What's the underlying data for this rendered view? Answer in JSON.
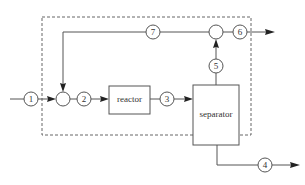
{
  "diagram": {
    "type": "process-flow",
    "units": {
      "reactor": "reactor",
      "separator": "separator"
    },
    "streams": {
      "s1": "1",
      "s2": "2",
      "s3": "3",
      "s4": "4",
      "s5": "5",
      "s6": "6",
      "s7": "7"
    },
    "mixers": [
      "feed-mixer",
      "top-mixer"
    ],
    "boundary": "dashed system boundary",
    "connections": [
      {
        "from": "feed",
        "stream": "1",
        "to": "feed-mixer"
      },
      {
        "from": "feed-mixer",
        "stream": "2",
        "to": "reactor"
      },
      {
        "from": "reactor",
        "stream": "3",
        "to": "separator"
      },
      {
        "from": "separator",
        "stream": "4",
        "to": "bottom-product"
      },
      {
        "from": "separator",
        "stream": "5",
        "to": "top-mixer"
      },
      {
        "from": "top-mixer",
        "stream": "6",
        "to": "top-product"
      },
      {
        "from": "top-mixer",
        "stream": "7",
        "to": "feed-mixer",
        "note": "recycle"
      }
    ],
    "colors": {
      "line": "#555555",
      "arrow": "#222222",
      "text": "#333333",
      "background": "#ffffff"
    }
  }
}
